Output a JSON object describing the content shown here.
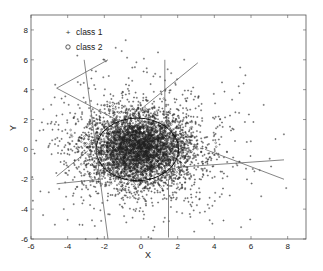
{
  "chart_data": {
    "type": "scatter",
    "title": "",
    "xlabel": "X",
    "ylabel": "Y",
    "xlim": [
      -6,
      9
    ],
    "ylim": [
      -6,
      9
    ],
    "xticks": [
      -6,
      -4,
      -2,
      0,
      2,
      4,
      6,
      8
    ],
    "yticks": [
      -6,
      -4,
      -2,
      0,
      2,
      4,
      6,
      8
    ],
    "xtick_labels": [
      "-6",
      "-4",
      "-2",
      "0",
      "2",
      "4",
      "6",
      "8"
    ],
    "ytick_labels": [
      "-6",
      "-4",
      "-2",
      "0",
      "2",
      "4",
      "6",
      "8"
    ],
    "grid": false,
    "legend_position": "upper-left",
    "series": [
      {
        "name": "class 1",
        "marker": "+",
        "description": "dense point cloud centered near (0, 0), broad spread extending toward upper-right and lower-left",
        "approx_center": [
          0,
          0
        ],
        "approx_std": [
          1.8,
          1.7
        ],
        "approx_count": 3000
      },
      {
        "name": "class 2",
        "marker": "o",
        "description": "compact elliptical cluster centered near (-0.2, 0.1)",
        "approx_center": [
          -0.2,
          0.1
        ],
        "approx_std": [
          1.2,
          1.0
        ],
        "approx_count": 1500
      }
    ],
    "ellipse": {
      "center": [
        -0.2,
        0.0
      ],
      "rx": 2.25,
      "ry": 2.1
    },
    "lines": [
      {
        "from": [
          -4.6,
          4.1
        ],
        "to": [
          -1.8,
          6.0
        ]
      },
      {
        "from": [
          -4.6,
          4.1
        ],
        "to": [
          -0.9,
          1.7
        ]
      },
      {
        "from": [
          -3.1,
          6.0
        ],
        "to": [
          -1.8,
          -6.0
        ]
      },
      {
        "from": [
          1.3,
          6.0
        ],
        "to": [
          1.3,
          2.3
        ]
      },
      {
        "from": [
          3.1,
          5.8
        ],
        "to": [
          0.2,
          2.9
        ]
      },
      {
        "from": [
          3.5,
          0.0
        ],
        "to": [
          7.8,
          -2.0
        ]
      },
      {
        "from": [
          1.9,
          -1.2
        ],
        "to": [
          7.8,
          -0.7
        ]
      },
      {
        "from": [
          -4.6,
          -1.8
        ],
        "to": [
          -2.9,
          -0.1
        ]
      },
      {
        "from": [
          -4.6,
          -2.3
        ],
        "to": [
          -2.2,
          -2.0
        ]
      },
      {
        "from": [
          1.5,
          -2.0
        ],
        "to": [
          1.5,
          -5.9
        ]
      }
    ]
  },
  "legend": {
    "items": [
      {
        "label": "class 1",
        "marker": "+"
      },
      {
        "label": "class 2",
        "marker": "o"
      }
    ]
  },
  "axes": {
    "xlabel": "X",
    "ylabel": "Y"
  }
}
